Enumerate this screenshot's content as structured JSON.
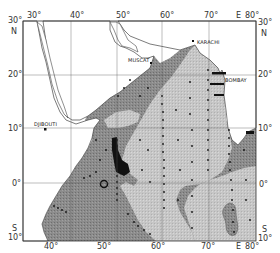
{
  "map": {
    "region": "Arabian Sea / Western Indian Ocean",
    "longitude_labels_top": [
      {
        "text": "30°",
        "x": 31
      },
      {
        "text": "40°",
        "x": 74
      },
      {
        "text": "50°",
        "x": 120
      },
      {
        "text": "60°",
        "x": 164
      },
      {
        "text": "70°",
        "x": 208
      },
      {
        "text": "E",
        "x": 238
      },
      {
        "text": "80°",
        "x": 246
      }
    ],
    "longitude_labels_bottom": [
      {
        "text": "40°",
        "x": 47
      },
      {
        "text": "50°",
        "x": 100
      },
      {
        "text": "60°",
        "x": 154
      },
      {
        "text": "70°",
        "x": 205
      },
      {
        "text": "E",
        "x": 238
      },
      {
        "text": "80°",
        "x": 246
      }
    ],
    "latitude_labels_left": [
      {
        "text": "30°",
        "y": 18
      },
      {
        "text": "N",
        "y": 28
      },
      {
        "text": "20°",
        "y": 70
      },
      {
        "text": "10°",
        "y": 124
      },
      {
        "text": "0°",
        "y": 180
      },
      {
        "text": "S",
        "y": 226
      },
      {
        "text": "10°",
        "y": 234
      }
    ],
    "latitude_labels_right": [
      {
        "text": "30°",
        "y": 18
      },
      {
        "text": "N",
        "y": 28
      },
      {
        "text": "20°",
        "y": 70
      },
      {
        "text": "10°",
        "y": 124
      },
      {
        "text": "0°",
        "y": 180
      },
      {
        "text": "S",
        "y": 226
      },
      {
        "text": "10°",
        "y": 234
      }
    ],
    "cities": [
      {
        "name": "KARACHI",
        "x": 197,
        "y": 42
      },
      {
        "name": "MUSCAT",
        "x": 148,
        "y": 58
      },
      {
        "name": "BOMBAY",
        "x": 225,
        "y": 79
      },
      {
        "name": "DJIBOUTI",
        "x": 34,
        "y": 131
      }
    ],
    "colors": {
      "background": "#ffffff",
      "land": "#ffffff",
      "dark_zone": "#8a8a8a",
      "light_zone": "#c4c4c4",
      "core_zone": "#111111",
      "station_dot": "#111111",
      "frame": "#333333",
      "grid": "#555555"
    }
  }
}
